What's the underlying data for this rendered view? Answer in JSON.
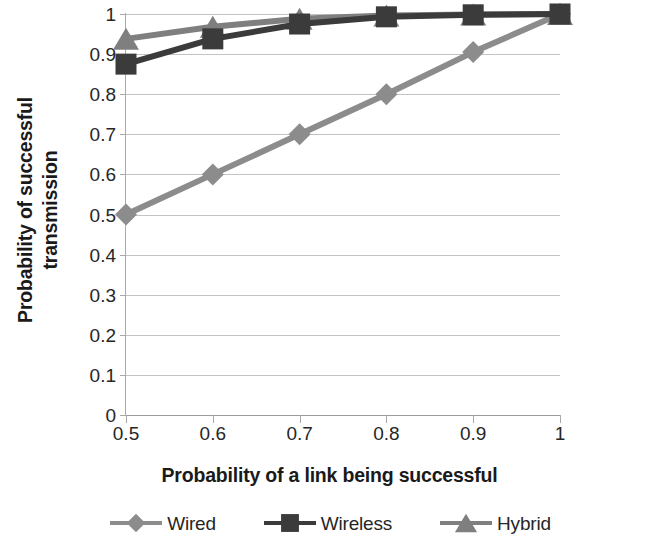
{
  "chart_data": {
    "type": "line",
    "title": "",
    "xlabel": "Probability of a link being successful",
    "ylabel": "Probability of successful transmission",
    "ylabel_line1": "Probability of successful",
    "ylabel_line2": "transmission",
    "x": [
      0.5,
      0.6,
      0.7,
      0.8,
      0.9,
      1
    ],
    "xticklabels": [
      "0.5",
      "0.6",
      "0.7",
      "0.8",
      "0.9",
      "1"
    ],
    "yticklabels": [
      "1",
      "0.9",
      "0.8",
      "0.7",
      "0.6",
      "0.5",
      "0.4",
      "0.3",
      "0.2",
      "0.1",
      "0"
    ],
    "yticks": [
      1,
      0.9,
      0.8,
      0.7,
      0.6,
      0.5,
      0.4,
      0.3,
      0.2,
      0.1,
      0
    ],
    "xlim": [
      0.5,
      1
    ],
    "ylim": [
      0,
      1
    ],
    "grid": "horizontal",
    "legend_position": "bottom",
    "series": [
      {
        "name": "Wired",
        "marker": "diamond",
        "color": "#8c8c8c",
        "values": [
          0.5,
          0.6,
          0.7,
          0.8,
          0.905,
          1
        ]
      },
      {
        "name": "Wireless",
        "marker": "square",
        "color": "#3b3b3b",
        "values": [
          0.875,
          0.938,
          0.975,
          0.993,
          0.998,
          1
        ]
      },
      {
        "name": "Hybrid",
        "marker": "triangle",
        "color": "#7f7f7f",
        "values": [
          0.938,
          0.968,
          0.988,
          0.996,
          0.999,
          1
        ]
      }
    ]
  },
  "legend": {
    "items": [
      {
        "label": "Wired",
        "marker": "diamond",
        "color": "#8c8c8c"
      },
      {
        "label": "Wireless",
        "marker": "square",
        "color": "#3b3b3b"
      },
      {
        "label": "Hybrid",
        "marker": "triangle",
        "color": "#7f7f7f"
      }
    ]
  },
  "colors": {
    "gridline": "#b9b9bb",
    "axis": "#a9a9ab",
    "text": "#262626",
    "title_text": "#1a1a1a",
    "background": "#ffffff"
  }
}
